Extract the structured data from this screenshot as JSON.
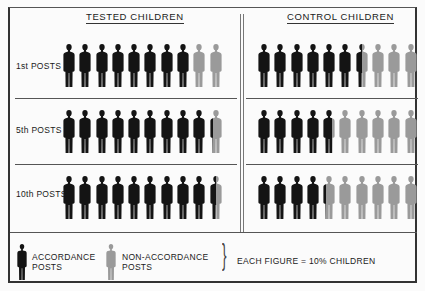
{
  "chart_data": {
    "type": "pictograph",
    "title": "",
    "unit": "Each figure = 10% children",
    "categories": [
      "1st POSTS",
      "5th POSTS",
      "10th POSTS"
    ],
    "series": [
      {
        "name": "TESTED CHILDREN",
        "accordance_percent": [
          80,
          92,
          95
        ]
      },
      {
        "name": "CONTROL CHILDREN",
        "accordance_percent": [
          65,
          48,
          42
        ]
      }
    ],
    "legend": [
      {
        "label": "ACCORDANCE POSTS",
        "color": "#141414"
      },
      {
        "label": "NON-ACCORDANCE POSTS",
        "color": "#9a9a9a"
      }
    ],
    "figures_per_row": 10
  },
  "panels": {
    "tested_title": "TESTED CHILDREN",
    "control_title": "CONTROL CHILDREN"
  },
  "rows": [
    {
      "label": "1st POSTS"
    },
    {
      "label": "5th POSTS"
    },
    {
      "label": "10th POSTS"
    }
  ],
  "legend": {
    "accordance_line1": "ACCORDANCE",
    "accordance_line2": "POSTS",
    "non_accordance_line1": "NON-ACCORDANCE",
    "non_accordance_line2": "POSTS",
    "brace": "}",
    "scale_note": "EACH FIGURE = 10% CHILDREN"
  },
  "colors": {
    "accordance": "#141414",
    "non_accordance": "#9a9a9a"
  }
}
